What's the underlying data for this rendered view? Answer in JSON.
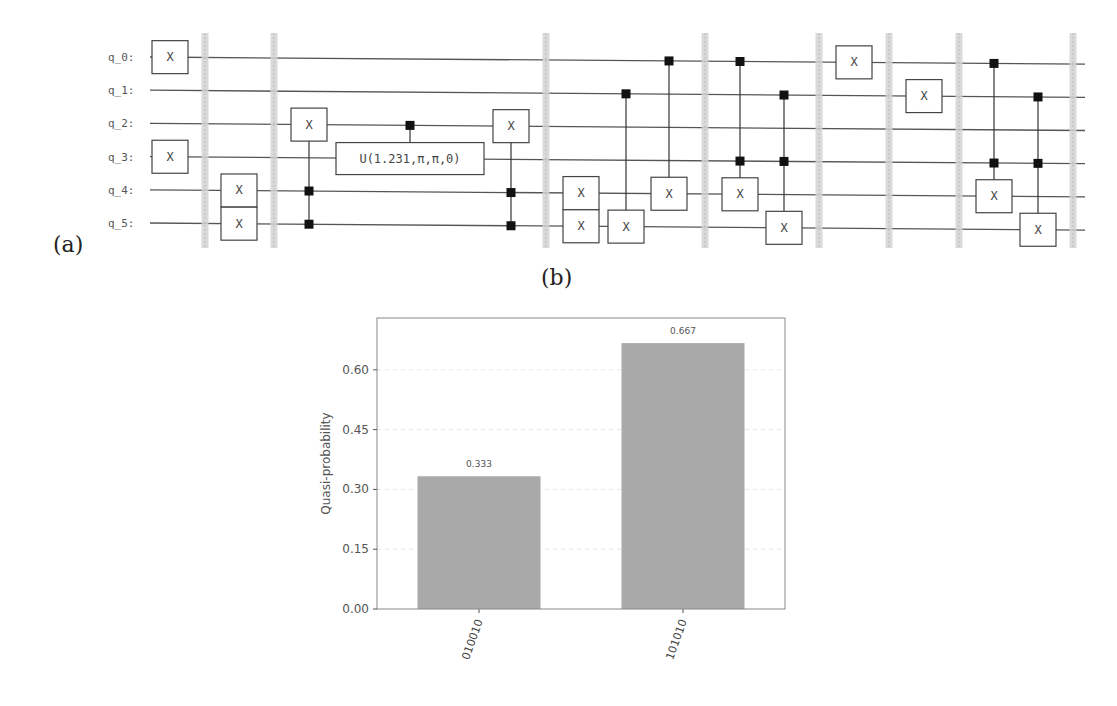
{
  "figure": {
    "panel_a_label": "(a)",
    "panel_b_label": "(b)"
  },
  "circuit": {
    "qubits": [
      "q_0:",
      "q_1:",
      "q_2:",
      "q_3:",
      "q_4:",
      "q_5:"
    ],
    "barrier_positions": [
      205,
      274,
      546,
      705,
      819,
      889,
      959,
      1073
    ],
    "gates": [
      {
        "type": "x",
        "x": 170,
        "qubit": 0,
        "label": "X"
      },
      {
        "type": "x",
        "x": 170,
        "qubit": 3,
        "label": "X"
      },
      {
        "type": "x",
        "x": 239,
        "qubit": 4,
        "label": "X"
      },
      {
        "type": "x",
        "x": 239,
        "qubit": 5,
        "label": "X"
      },
      {
        "type": "ccx",
        "x": 309,
        "controls": [
          4,
          5
        ],
        "target": 2,
        "label": "X"
      },
      {
        "type": "cu",
        "x": 410,
        "control": 2,
        "target": 3,
        "label": "U(1.231,π,π,0)"
      },
      {
        "type": "ccx",
        "x": 511,
        "controls": [
          4,
          5
        ],
        "target": 2,
        "label": "X"
      },
      {
        "type": "x",
        "x": 581,
        "qubit": 4,
        "label": "X"
      },
      {
        "type": "x",
        "x": 581,
        "qubit": 5,
        "label": "X"
      },
      {
        "type": "cx",
        "x": 626,
        "controls": [
          1
        ],
        "target": 5,
        "label": "X"
      },
      {
        "type": "cx",
        "x": 669,
        "controls": [
          0
        ],
        "target": 4,
        "label": "X"
      },
      {
        "type": "ccx",
        "x": 740,
        "controls": [
          0,
          3
        ],
        "target": 4,
        "label": "X"
      },
      {
        "type": "ccx",
        "x": 784,
        "controls": [
          1,
          3
        ],
        "target": 5,
        "label": "X"
      },
      {
        "type": "x",
        "x": 854,
        "qubit": 0,
        "label": "X"
      },
      {
        "type": "x",
        "x": 924,
        "qubit": 1,
        "label": "X"
      },
      {
        "type": "ccx",
        "x": 994,
        "controls": [
          0,
          3
        ],
        "target": 4,
        "label": "X"
      },
      {
        "type": "ccx",
        "x": 1038,
        "controls": [
          1,
          3
        ],
        "target": 5,
        "label": "X"
      }
    ]
  },
  "chart_data": {
    "type": "bar",
    "title": "",
    "xlabel": "",
    "ylabel": "Quasi-probability",
    "categories": [
      "010010",
      "101010"
    ],
    "values": [
      0.333,
      0.667
    ],
    "value_labels": [
      "0.333",
      "0.667"
    ],
    "yticks": [
      "0.00",
      "0.15",
      "0.30",
      "0.45",
      "0.60"
    ],
    "ytick_values": [
      0,
      0.15,
      0.3,
      0.45,
      0.6
    ],
    "ylim": [
      0,
      0.73
    ],
    "grid": true,
    "legend": null,
    "bar_color": "#a9a9a9",
    "xtick_rotation": -70
  }
}
